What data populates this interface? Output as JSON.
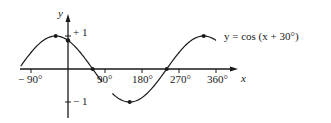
{
  "chart_data": {
    "type": "line",
    "title": "",
    "equation_label": "y = cos (x + 30°)",
    "xlabel": "x",
    "ylabel": "y",
    "xlim": [
      -120,
      375
    ],
    "ylim": [
      -1.25,
      1.6
    ],
    "x_ticks": [
      {
        "value": -90,
        "label": "− 90°"
      },
      {
        "value": 90,
        "label": "90°"
      },
      {
        "value": 180,
        "label": "180°"
      },
      {
        "value": 270,
        "label": "270°"
      },
      {
        "value": 360,
        "label": "360°"
      }
    ],
    "y_ticks": [
      {
        "value": 1,
        "label": "+ 1"
      },
      {
        "value": -1,
        "label": "− 1"
      }
    ],
    "series": [
      {
        "name": "y = cos (x + 30°)",
        "function": "cos(x + 30°)",
        "x_range": [
          -115,
          360
        ],
        "marked_points": [
          {
            "x": -30,
            "y": 1
          },
          {
            "x": 0,
            "y": 0.866
          },
          {
            "x": 60,
            "y": 0
          },
          {
            "x": 150,
            "y": -1
          },
          {
            "x": 240,
            "y": 0
          },
          {
            "x": 330,
            "y": 1
          }
        ]
      }
    ],
    "grid": false,
    "legend": "none"
  },
  "labels": {
    "y_axis": "y",
    "x_axis": "x",
    "plus_one": "+ 1",
    "minus_one": "− 1",
    "tick_neg90": "− 90°",
    "tick_90": "90°",
    "tick_180": "180°",
    "tick_270": "270°",
    "tick_360": "360°",
    "equation": "y = cos (x + 30°)"
  }
}
